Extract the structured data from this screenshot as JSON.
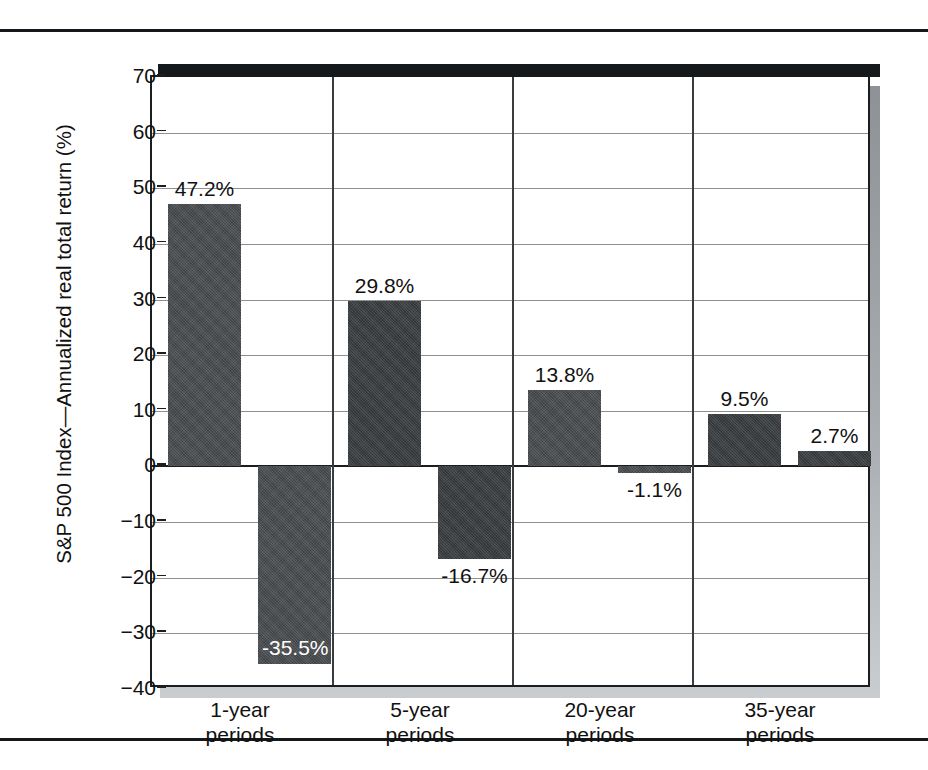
{
  "figure": {
    "y_axis_title": "S&P 500 Index—Annualized real total return (%)",
    "caption_sliver": "                    "
  },
  "chart_data": {
    "type": "bar",
    "title": "",
    "xlabel": "",
    "ylabel": "S&P 500 Index—Annualized real total return (%)",
    "ylim": [
      -40,
      70
    ],
    "ytick_labels": [
      "70",
      "60",
      "50",
      "40",
      "30",
      "20",
      "10",
      "0",
      "−10",
      "−20",
      "−30",
      "−40"
    ],
    "ytick_values": [
      70,
      60,
      50,
      40,
      30,
      20,
      10,
      0,
      -10,
      -20,
      -30,
      -40
    ],
    "grid": true,
    "legend": "none",
    "categories": [
      "1-year\nperiods",
      "5-year\nperiods",
      "20-year\nperiods",
      "35-year\nperiods"
    ],
    "category_lines": [
      [
        "1-year",
        "periods"
      ],
      [
        "5-year",
        "periods"
      ],
      [
        "20-year",
        "periods"
      ],
      [
        "35-year",
        "periods"
      ]
    ],
    "series": [
      {
        "name": "Best",
        "values": [
          47.2,
          29.8,
          13.8,
          9.5
        ]
      },
      {
        "name": "Worst",
        "values": [
          -35.5,
          -16.7,
          -1.1,
          2.7
        ]
      }
    ],
    "bars": [
      {
        "group": 0,
        "which": "best",
        "value": 47.2,
        "label": "47.2%",
        "label_position": "above",
        "shade": "mid"
      },
      {
        "group": 0,
        "which": "worst",
        "value": -35.5,
        "label": "-35.5%",
        "label_position": "inside",
        "shade": "mid"
      },
      {
        "group": 1,
        "which": "best",
        "value": 29.8,
        "label": "29.8%",
        "label_position": "above",
        "shade": "dark"
      },
      {
        "group": 1,
        "which": "worst",
        "value": -16.7,
        "label": "-16.7%",
        "label_position": "below",
        "shade": "dark"
      },
      {
        "group": 2,
        "which": "best",
        "value": 13.8,
        "label": "13.8%",
        "label_position": "above",
        "shade": "mid"
      },
      {
        "group": 2,
        "which": "worst",
        "value": -1.1,
        "label": "-1.1%",
        "label_position": "below",
        "shade": "mid"
      },
      {
        "group": 3,
        "which": "best",
        "value": 9.5,
        "label": "9.5%",
        "label_position": "above",
        "shade": "dark"
      },
      {
        "group": 3,
        "which": "worst",
        "value": 2.7,
        "label": "2.7%",
        "label_position": "above",
        "shade": "dark"
      }
    ],
    "colors": {
      "bar_mid": "#4a4d50",
      "bar_dark": "#3a3d40",
      "axis": "#1b1e20",
      "gridline": "#8d9194",
      "background": "#ffffff",
      "shadow": "#a9adb1"
    }
  }
}
